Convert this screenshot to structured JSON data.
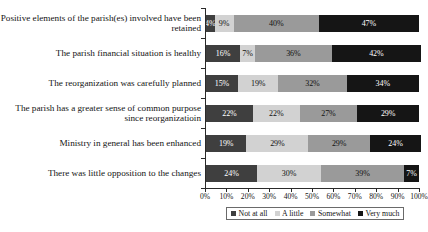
{
  "chart_data": {
    "type": "bar",
    "orientation": "horizontal",
    "stacked": true,
    "stack_mode": "percent",
    "title": "",
    "xlabel": "",
    "ylabel": "",
    "xlim": [
      0,
      100
    ],
    "grid": false,
    "legend_position": "bottom",
    "tick_labels": [
      "0%",
      "10%",
      "20%",
      "30%",
      "40%",
      "50%",
      "60%",
      "70%",
      "80%",
      "90%",
      "100%"
    ],
    "tick_values": [
      0,
      10,
      20,
      30,
      40,
      50,
      60,
      70,
      80,
      90,
      100
    ],
    "categories": [
      "Positive elements of the parish(es) involved have been retained",
      "The parish financial situation is healthy",
      "The reorganization was carefully planned",
      "The parish has a greater sense of common purpose since reorganizatioin",
      "Ministry in general has been enhanced",
      "There was little opposition to the changes"
    ],
    "series": [
      {
        "name": "Not at all",
        "color": "#3f3f3f",
        "values": [
          4,
          16,
          15,
          22,
          19,
          24
        ]
      },
      {
        "name": "A little",
        "color": "#d2d2d2",
        "values": [
          9,
          7,
          19,
          22,
          29,
          30
        ]
      },
      {
        "name": "Somewhat",
        "color": "#9a9a9a",
        "values": [
          40,
          36,
          32,
          27,
          29,
          39
        ]
      },
      {
        "name": "Very much",
        "color": "#151515",
        "values": [
          47,
          42,
          34,
          29,
          24,
          7
        ]
      }
    ],
    "data_labels": [
      [
        "4%",
        "9%",
        "40%",
        "47%"
      ],
      [
        "16%",
        "7%",
        "36%",
        "42%"
      ],
      [
        "15%",
        "19%",
        "32%",
        "34%"
      ],
      [
        "22%",
        "22%",
        "27%",
        "29%"
      ],
      [
        "19%",
        "29%",
        "29%",
        "24%"
      ],
      [
        "24%",
        "30%",
        "39%",
        "7%"
      ]
    ]
  }
}
